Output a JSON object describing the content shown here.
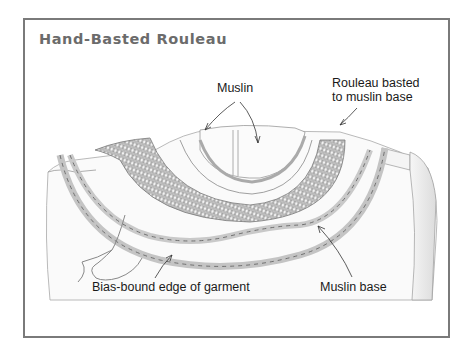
{
  "title": "Hand-Basted Rouleau",
  "labels": {
    "muslin": "Muslin",
    "rouleau": "Rouleau basted to muslin base",
    "rouleau_line1": "Rouleau basted",
    "rouleau_line2": "to muslin base",
    "bias_edge": "Bias-bound edge of garment",
    "muslin_base": "Muslin base"
  },
  "colors": {
    "frame": "#7a7a7a",
    "title": "#6b6b6b",
    "line_art": "#8a8a8a",
    "label_text": "#1a1a1a"
  }
}
